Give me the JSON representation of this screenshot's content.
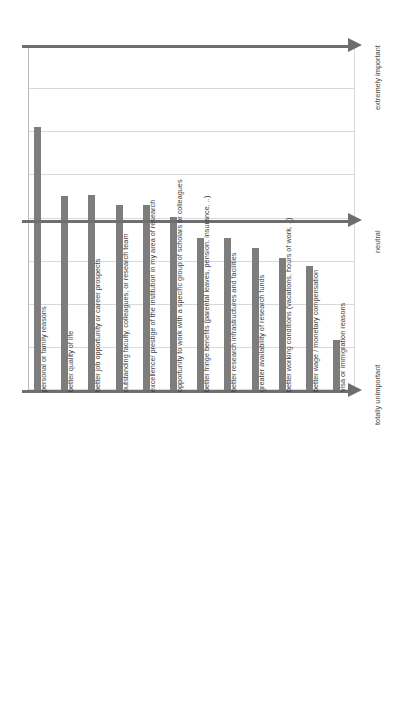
{
  "chart_data": {
    "type": "bar",
    "title": "",
    "subtitle": "",
    "xlabel": "",
    "ylabel": "",
    "orientation": "vertical",
    "grid": true,
    "legend": null,
    "axis_scale_labels": [
      {
        "label": "extremely important",
        "value": 8,
        "position": "top"
      },
      {
        "label": "neutral",
        "value": 4,
        "position": "middle"
      },
      {
        "label": "totally unimportant",
        "value": 0,
        "position": "bottom"
      }
    ],
    "ylim": [
      0,
      8
    ],
    "ytick_values": [
      0,
      1,
      2,
      3,
      4,
      5,
      6,
      7,
      8
    ],
    "categories": [
      "personal or family reasons",
      "better quality of life",
      "better job opportunity or career prospects",
      "outstanding faculty, colleagues, or research team",
      "excellence/ prestige of the institution in my area of research",
      "opportunity to work with a specific group of scholars or colleagues",
      "better fringe benefits (parental leaves, pension, insurance, ..)",
      "better research infrastructures and facilities",
      "greater availability of research funds",
      "better working conditions (vacations, hours of work, ..)",
      "better wage / monetary compensation",
      "visa or immigration reasons"
    ],
    "values": [
      6.1,
      4.5,
      4.52,
      4.29,
      4.29,
      4.01,
      3.53,
      3.53,
      3.29,
      3.06,
      2.88,
      1.16
    ],
    "bar_color": "#7d7d7d",
    "grid_color": "#d9d9d9",
    "axis_color": "#6e6e6e"
  }
}
